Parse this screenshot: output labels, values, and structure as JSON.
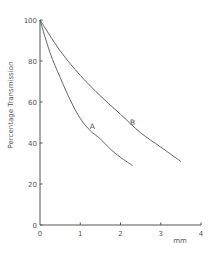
{
  "chart_data": {
    "type": "line",
    "title": "",
    "xlabel": "mm",
    "ylabel": "Percentage Transmission",
    "xlim": [
      0,
      4
    ],
    "ylim": [
      0,
      100
    ],
    "x_ticks": [
      0,
      1,
      2,
      3,
      4
    ],
    "x_tick_labels": [
      "0",
      "1",
      "2",
      "3",
      "4"
    ],
    "y_ticks": [
      0,
      20,
      40,
      60,
      80,
      100
    ],
    "y_tick_labels": [
      "0",
      "20",
      "40",
      "60",
      "80",
      "100"
    ],
    "grid": false,
    "legend": "inline labels on curves",
    "series": [
      {
        "name": "A",
        "x": [
          0,
          0.25,
          0.5,
          0.75,
          1.0,
          1.25,
          1.5,
          1.75,
          2.0,
          2.3
        ],
        "values": [
          100,
          84,
          72,
          61,
          52,
          46,
          42,
          37,
          33,
          29
        ],
        "label_at": [
          1.3,
          47
        ]
      },
      {
        "name": "B",
        "x": [
          0,
          0.5,
          1.0,
          1.5,
          2.0,
          2.5,
          3.0,
          3.5
        ],
        "values": [
          100,
          85,
          73,
          63,
          54,
          45,
          38,
          31
        ],
        "label_at": [
          2.3,
          49
        ]
      }
    ]
  },
  "colors": {
    "line": "#555555",
    "axis": "#555555",
    "text": "#555555"
  }
}
